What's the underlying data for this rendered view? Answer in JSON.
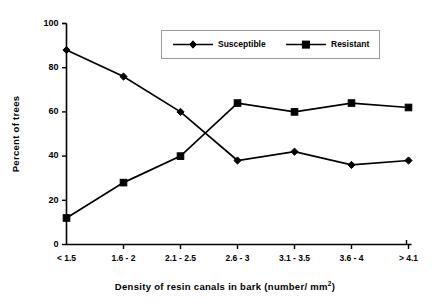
{
  "chart_data": {
    "type": "line",
    "title": "",
    "xlabel": "Density of resin canals in bark (number/ mm2)",
    "xlabel_main": "Density of resin canals in bark (number/ mm",
    "xlabel_sup": "2",
    "xlabel_tail": ")",
    "ylabel": "Percent of trees",
    "categories": [
      "< 1.5",
      "1.6 - 2",
      "2.1 - 2.5",
      "2.6 - 3",
      "3.1 - 3.5",
      "3.6 - 4",
      "> 4.1"
    ],
    "ylim": [
      0,
      100
    ],
    "yticks": [
      0,
      20,
      40,
      60,
      80,
      100
    ],
    "ytick_labels": [
      "0",
      "20",
      "40",
      "60",
      "80",
      "100"
    ],
    "grid": false,
    "legend_position": "top-center",
    "series": [
      {
        "name": "Susceptible",
        "marker": "diamond",
        "color": "#000000",
        "values": [
          88,
          76,
          60,
          38,
          42,
          36,
          38
        ]
      },
      {
        "name": "Resistant",
        "marker": "square",
        "color": "#000000",
        "values": [
          12,
          28,
          40,
          64,
          60,
          64,
          62
        ]
      }
    ]
  },
  "legend": {
    "items": [
      {
        "label": "Susceptible"
      },
      {
        "label": "Resistant"
      }
    ]
  },
  "colors": {
    "ink": "#000000",
    "background": "#ffffff",
    "legend_border": "#9a9a9a"
  }
}
